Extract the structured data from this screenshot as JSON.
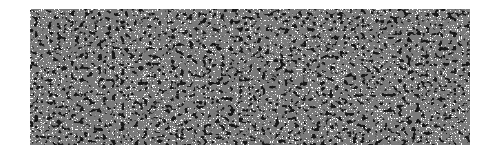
{
  "image": {
    "description": "Black-and-white noise texture with short worm-like strokes",
    "region": {
      "x": 30,
      "y": 9,
      "width": 440,
      "height": 136
    },
    "colors": {
      "background": "#ffffff",
      "ink": "#111111"
    }
  }
}
